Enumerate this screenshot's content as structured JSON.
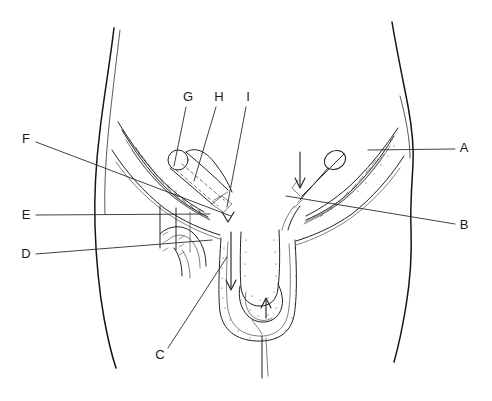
{
  "figure": {
    "kind": "anatomical-line-drawing",
    "background_color": "#ffffff",
    "ink_color": "#1a1a1a",
    "width": 492,
    "height": 401
  },
  "labels": [
    {
      "id": "A",
      "text": "A",
      "x": 464,
      "y": 149,
      "side": "right",
      "leader": {
        "x1": 455,
        "y1": 149,
        "x2": 368,
        "y2": 150
      }
    },
    {
      "id": "B",
      "text": "B",
      "x": 464,
      "y": 226,
      "side": "right",
      "leader": {
        "x1": 455,
        "y1": 224,
        "x2": 286,
        "y2": 196
      }
    },
    {
      "id": "C",
      "text": "C",
      "x": 160,
      "y": 356,
      "side": "bottom-left",
      "leader": {
        "x1": 168,
        "y1": 348,
        "x2": 227,
        "y2": 257
      }
    },
    {
      "id": "D",
      "text": "D",
      "x": 26,
      "y": 255,
      "side": "left",
      "leader": {
        "x1": 36,
        "y1": 254,
        "x2": 212,
        "y2": 240
      }
    },
    {
      "id": "E",
      "text": "E",
      "x": 26,
      "y": 216,
      "side": "left",
      "leader": {
        "x1": 36,
        "y1": 215,
        "x2": 210,
        "y2": 214
      }
    },
    {
      "id": "F",
      "text": "F",
      "x": 26,
      "y": 140,
      "side": "left",
      "leader": {
        "x1": 36,
        "y1": 142,
        "x2": 231,
        "y2": 216
      }
    },
    {
      "id": "G",
      "text": "G",
      "x": 188,
      "y": 98,
      "side": "top",
      "leader": {
        "x1": 186,
        "y1": 107,
        "x2": 174,
        "y2": 166
      }
    },
    {
      "id": "H",
      "text": "H",
      "x": 219,
      "y": 98,
      "side": "top",
      "leader": {
        "x1": 216,
        "y1": 107,
        "x2": 194,
        "y2": 181
      }
    },
    {
      "id": "I",
      "text": "I",
      "x": 248,
      "y": 98,
      "side": "top",
      "leader": {
        "x1": 246,
        "y1": 107,
        "x2": 227,
        "y2": 207
      }
    }
  ],
  "regions": [
    {
      "name": "left-torso-outline"
    },
    {
      "name": "right-torso-outline"
    },
    {
      "name": "left-inguinal-canal"
    },
    {
      "name": "right-inguinal-canal"
    },
    {
      "name": "left-spermatic-cord"
    },
    {
      "name": "right-spermatic-cord"
    },
    {
      "name": "penis"
    },
    {
      "name": "scrotum"
    },
    {
      "name": "descent-arrow"
    }
  ]
}
